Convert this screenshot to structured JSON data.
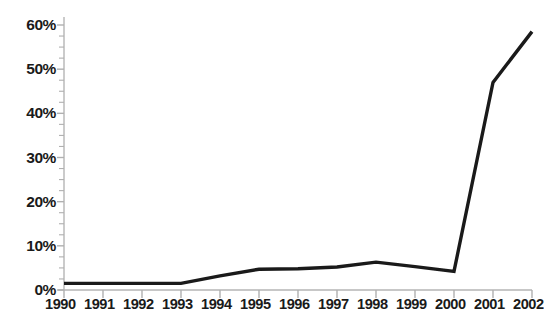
{
  "chart_data": {
    "type": "line",
    "title": "",
    "subtitle": "",
    "xlabel": "",
    "ylabel": "",
    "categories": [
      "1990",
      "1991",
      "1992",
      "1993",
      "1994",
      "1995",
      "1996",
      "1997",
      "1998",
      "1999",
      "2000",
      "2001",
      "2002"
    ],
    "x": [
      1990,
      1991,
      1992,
      1993,
      1994,
      1995,
      1996,
      1997,
      1998,
      1999,
      2000,
      2001,
      2002
    ],
    "values": [
      1.5,
      1.5,
      1.5,
      1.5,
      3.2,
      4.7,
      4.8,
      5.2,
      6.3,
      5.3,
      4.2,
      47.0,
      58.5
    ],
    "series": [
      {
        "name": "",
        "values": [
          1.5,
          1.5,
          1.5,
          1.5,
          3.2,
          4.7,
          4.8,
          5.2,
          6.3,
          5.3,
          4.2,
          47.0,
          58.5
        ]
      }
    ],
    "ylim": [
      0,
      60
    ],
    "xlim": [
      1990,
      2002
    ],
    "ytick_labels": [
      "0%",
      "10%",
      "20%",
      "30%",
      "40%",
      "50%",
      "60%"
    ],
    "ytick_values": [
      0,
      10,
      20,
      30,
      40,
      50,
      60
    ],
    "yminor_step": 2.5,
    "value_format": "percent",
    "grid": false,
    "legend": null,
    "legend_position": "none",
    "annotations": []
  },
  "style": {
    "line_color": "#1a1a1a",
    "axis_color": "#b5b5b5",
    "tick_color": "#b0b0b0",
    "text_color": "#1a1a1a",
    "background": "#ffffff",
    "line_width": 3.4
  }
}
